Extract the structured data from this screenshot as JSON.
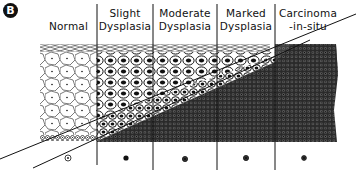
{
  "panel": {
    "label": "B"
  },
  "columns": [
    {
      "id": "normal",
      "label": "Normal",
      "label_lines": [
        "",
        "Normal"
      ]
    },
    {
      "id": "slight",
      "label": "Slight Dysplasia",
      "label_lines": [
        "Slight",
        "Dysplasia"
      ]
    },
    {
      "id": "moderate",
      "label": "Moderate Dysplasia",
      "label_lines": [
        "Moderate",
        "Dysplasia"
      ]
    },
    {
      "id": "marked",
      "label": "Marked Dysplasia",
      "label_lines": [
        "Marked",
        "Dysplasia"
      ]
    },
    {
      "id": "cis",
      "label": "Carcinoma-in-situ",
      "label_lines": [
        "Carcinoma",
        "-in-situ"
      ]
    }
  ],
  "colors": {
    "ink": "#111111",
    "background": "#ffffff"
  }
}
